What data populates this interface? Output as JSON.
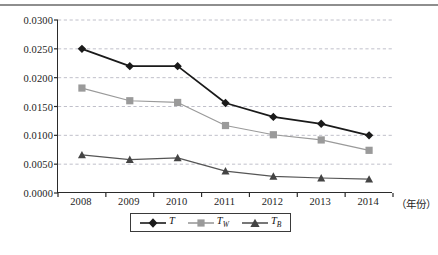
{
  "chart_data": {
    "type": "line",
    "title": "",
    "xlabel": "（年份）",
    "ylabel": "",
    "categories": [
      "2008",
      "2009",
      "2010",
      "2011",
      "2012",
      "2013",
      "2014"
    ],
    "ylim": [
      0.0,
      0.03
    ],
    "ytick_labels": [
      "0.0000",
      "0.0050",
      "0.0100",
      "0.0150",
      "0.0200",
      "0.0250",
      "0.0300"
    ],
    "ytick_values": [
      0.0,
      0.005,
      0.01,
      0.015,
      0.02,
      0.025,
      0.03
    ],
    "grid": "horizontal-dashed",
    "legend_position": "bottom-center",
    "series": [
      {
        "name": "T",
        "label": "T",
        "subscript": "",
        "marker": "diamond",
        "color": "#1a1a1a",
        "values": [
          0.025,
          0.022,
          0.022,
          0.0156,
          0.0132,
          0.012,
          0.01
        ]
      },
      {
        "name": "T_W",
        "label": "T",
        "subscript": "W",
        "marker": "square",
        "color": "#9a9a9a",
        "values": [
          0.0182,
          0.016,
          0.0157,
          0.0117,
          0.0101,
          0.0092,
          0.0074
        ]
      },
      {
        "name": "T_B",
        "label": "T",
        "subscript": "B",
        "marker": "triangle",
        "color": "#555555",
        "values": [
          0.0066,
          0.0058,
          0.0061,
          0.0038,
          0.0029,
          0.0026,
          0.0024
        ]
      }
    ]
  },
  "axis": {
    "x_unit_note": "（年份）"
  },
  "colors": {
    "axis": "#2b2b2b",
    "grid": "#b9b9c4",
    "series_t": "#1a1a1a",
    "series_tw": "#9a9a9a",
    "series_tb": "#555555",
    "background": "#ffffff"
  }
}
